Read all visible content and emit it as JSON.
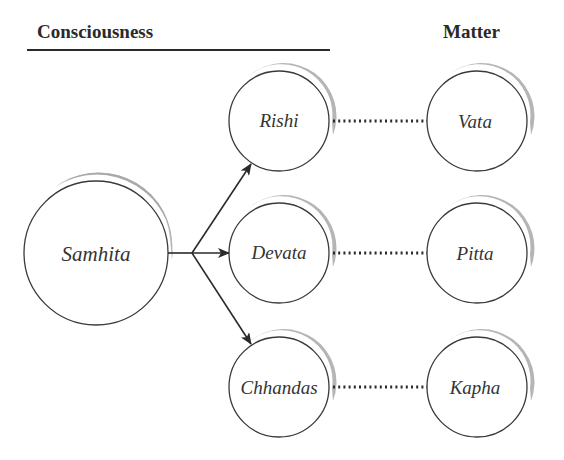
{
  "headers": {
    "left": "Consciousness",
    "right": "Matter"
  },
  "colors": {
    "stroke": "#3a3a3a",
    "shadow": "#9a9a9a",
    "text": "#333333",
    "background": "#ffffff"
  },
  "nodes": {
    "source": {
      "label": "Samhita"
    },
    "consciousness": [
      {
        "label": "Rishi"
      },
      {
        "label": "Devata"
      },
      {
        "label": "Chhandas"
      }
    ],
    "matter": [
      {
        "label": "Vata"
      },
      {
        "label": "Pitta"
      },
      {
        "label": "Kapha"
      }
    ]
  },
  "edges": {
    "arrows": [
      {
        "from": "Samhita",
        "to": "Rishi",
        "style": "solid-arrow"
      },
      {
        "from": "Samhita",
        "to": "Devata",
        "style": "solid-arrow"
      },
      {
        "from": "Samhita",
        "to": "Chhandas",
        "style": "solid-arrow"
      }
    ],
    "links": [
      {
        "from": "Rishi",
        "to": "Vata",
        "style": "dotted"
      },
      {
        "from": "Devata",
        "to": "Pitta",
        "style": "dotted"
      },
      {
        "from": "Chhandas",
        "to": "Kapha",
        "style": "dotted"
      }
    ]
  }
}
